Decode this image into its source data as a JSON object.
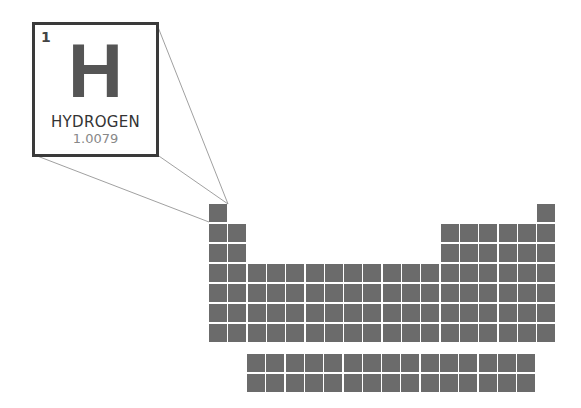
{
  "element": {
    "atomic_number": "1",
    "symbol": "H",
    "name": "HYDROGEN",
    "atomic_mass": "1.0079"
  },
  "colors": {
    "cell": "#6b6b6b",
    "callout_border": "#3a3a3a",
    "symbol": "#555555",
    "mass": "#888888"
  },
  "grid": {
    "origin_x": 209,
    "origin_y": 204,
    "pitch_x": 19.3,
    "pitch_y": 20,
    "rows": [
      [
        1,
        18
      ],
      [
        1,
        2,
        13,
        14,
        15,
        16,
        17,
        18
      ],
      [
        1,
        2,
        13,
        14,
        15,
        16,
        17,
        18
      ],
      [
        1,
        2,
        3,
        4,
        5,
        6,
        7,
        8,
        9,
        10,
        11,
        12,
        13,
        14,
        15,
        16,
        17,
        18
      ],
      [
        1,
        2,
        3,
        4,
        5,
        6,
        7,
        8,
        9,
        10,
        11,
        12,
        13,
        14,
        15,
        16,
        17,
        18
      ],
      [
        1,
        2,
        3,
        4,
        5,
        6,
        7,
        8,
        9,
        10,
        11,
        12,
        13,
        14,
        15,
        16,
        17,
        18
      ],
      [
        1,
        2,
        3,
        4,
        5,
        6,
        7,
        8,
        9,
        10,
        11,
        12,
        13,
        14,
        15,
        16,
        17,
        18
      ]
    ],
    "f_block": {
      "origin_x": 247,
      "origin_y": 354,
      "columns": 15,
      "rows": 2
    }
  }
}
